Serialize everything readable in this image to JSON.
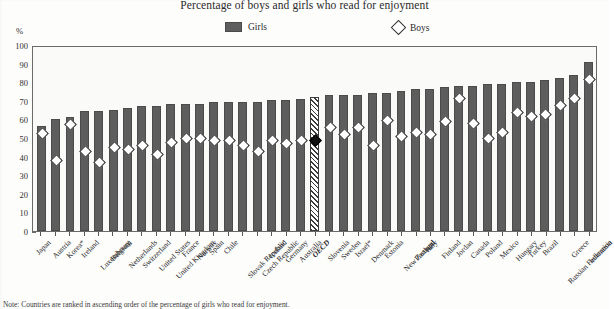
{
  "title": "Percentage of boys and girls who read for enjoyment",
  "axis": {
    "unit_label": "%"
  },
  "legend": {
    "girls": {
      "label": "Girls",
      "icon": "filled-square-icon",
      "color": "#5d5d5d"
    },
    "boys": {
      "label": "Boys",
      "icon": "open-diamond-icon",
      "color": "#ffffff"
    }
  },
  "footnote": "Note: Countries are ranked in ascending order of the percentage of girls who read for enjoyment.",
  "chart_data": {
    "type": "bar",
    "title": "Percentage of boys and girls who read for enjoyment",
    "xlabel": "",
    "ylabel": "%",
    "ylim": [
      0,
      100
    ],
    "yticks": [
      0,
      10,
      20,
      30,
      40,
      50,
      60,
      70,
      80,
      90,
      100
    ],
    "grid": false,
    "legend_position": "top-center",
    "categories": [
      "Japan",
      "Austria",
      "Korea*",
      "Ireland",
      "Luxembourg",
      "Belgium",
      "Netherlands",
      "Switzerland",
      "United States",
      "United Kingdom",
      "France",
      "Norway",
      "Spain",
      "Chile",
      "Slovak Republic",
      "Czech Republic",
      "Iceland",
      "Germany",
      "Australia",
      "OECD",
      "Slovenia",
      "Sweden",
      "Israel*",
      "Denmark",
      "Estonia",
      "New Zealand",
      "Portugal",
      "Italy",
      "Finland",
      "Jordan",
      "Canada",
      "Poland",
      "Mexico",
      "Hungary",
      "Turkey",
      "Brazil",
      "Russian Federation",
      "Greece",
      "Indonesia"
    ],
    "highlight_category": "OECD",
    "series": [
      {
        "name": "Girls",
        "type": "bar",
        "values": [
          57,
          61,
          62,
          65,
          65,
          66,
          67,
          68,
          68,
          69,
          69,
          69,
          70,
          70,
          70,
          70,
          71,
          71,
          72,
          73,
          74,
          74,
          74,
          75,
          75,
          76,
          77,
          77,
          78,
          79,
          79,
          80,
          80,
          81,
          81,
          82,
          83,
          85,
          92
        ]
      },
      {
        "name": "Boys",
        "type": "scatter",
        "marker": "diamond",
        "values": [
          53,
          38,
          58,
          43,
          37,
          45,
          44,
          46,
          41,
          48,
          50,
          50,
          49,
          49,
          46,
          43,
          49,
          47,
          49,
          49,
          56,
          52,
          56,
          46,
          60,
          51,
          53,
          52,
          59,
          72,
          58,
          50,
          53,
          64,
          62,
          63,
          68,
          72,
          82
        ]
      }
    ]
  }
}
